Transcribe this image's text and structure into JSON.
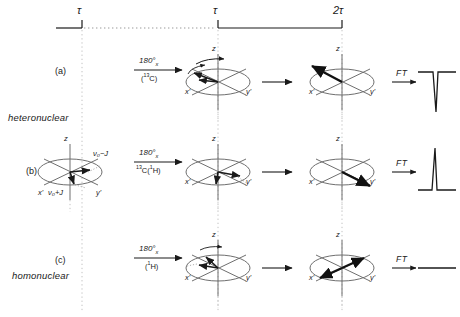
{
  "figure": {
    "type": "nmr-spin-echo-vector-diagram",
    "timeline": {
      "ticks": [
        {
          "label": "τ",
          "x": 82
        },
        {
          "label": "τ",
          "x": 218
        },
        {
          "label": "2τ",
          "x": 342
        }
      ]
    },
    "rows": [
      {
        "id": "(a)",
        "class_label": "heteronuclear",
        "pulse_top": "180°",
        "pulse_sub": "x",
        "pulse_bottom_pre": "(",
        "pulse_bottom_iso": "13",
        "pulse_bottom_nuc": "C",
        "pulse_bottom_post": ")",
        "ft_label": "FT",
        "spectrum": "negative-peak",
        "axes": {
          "z": "z",
          "x": "x'",
          "y": "y'"
        },
        "state_mid": "dephasing-fan",
        "state_end": "refocused-minus-y"
      },
      {
        "id": "(b)",
        "class_label": "heteronuclear",
        "pulse_top": "180°",
        "pulse_sub": "x",
        "pulse_bottom_pre": "",
        "pulse_bottom_iso": "13",
        "pulse_bottom_nuc": "C(",
        "pulse_bottom_post": "H)",
        "pulse_bottom_iso2": "1",
        "ft_label": "FT",
        "spectrum": "positive-peak",
        "axes": {
          "z": "z",
          "x": "x'",
          "y": "y'"
        },
        "freq_upper": "ν₀−J",
        "freq_lower": "ν₀+J",
        "state_mid": "dephasing-fan",
        "state_end": "refocused-plus-y"
      },
      {
        "id": "(c)",
        "class_label": "homonuclear",
        "pulse_top": "180°",
        "pulse_sub": "x",
        "pulse_bottom_pre": "(",
        "pulse_bottom_iso": "1",
        "pulse_bottom_nuc": "H",
        "pulse_bottom_post": ")",
        "ft_label": "FT",
        "spectrum": "null-flat-line",
        "axes": {
          "z": "z",
          "x": "x'",
          "y": "y'"
        },
        "state_mid": "dephasing-fan",
        "state_end": "antiphase-cancelled"
      }
    ],
    "colors": {
      "ink": "#1a1a1a",
      "grid": "#8a8a8a",
      "dotted": "#b0b0b0"
    }
  }
}
